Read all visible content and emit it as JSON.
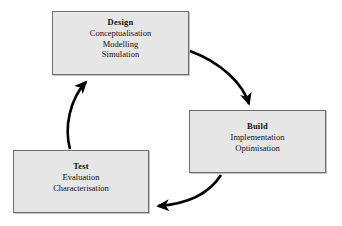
{
  "diagram": {
    "background_color": "#ffffff",
    "node_fill_color": "#e6e6e6",
    "node_border_color": "#6e6e6e",
    "arrow_color": "#000000",
    "nodes": [
      {
        "id": "design",
        "title": "Design",
        "lines": [
          "Conceptualisation",
          "Modelling",
          "Simulation"
        ]
      },
      {
        "id": "build",
        "title": "Build",
        "lines": [
          "Implementation",
          "Optimisation"
        ]
      },
      {
        "id": "test",
        "title": "Test",
        "lines": [
          "Evaluation",
          "Characterisation"
        ]
      }
    ],
    "arrows": [
      {
        "id": "design-to-build",
        "from": "design",
        "to": "build",
        "direction": "clockwise"
      },
      {
        "id": "build-to-test",
        "from": "build",
        "to": "test",
        "direction": "clockwise"
      },
      {
        "id": "test-to-design",
        "from": "test",
        "to": "design",
        "direction": "clockwise"
      }
    ]
  }
}
